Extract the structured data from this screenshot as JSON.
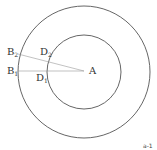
{
  "diagram": {
    "type": "concentric-circles",
    "center_label": "A",
    "outer_circle": {
      "cx": 84,
      "cy": 72,
      "r": 66
    },
    "inner_circle": {
      "cx": 84,
      "cy": 72,
      "r": 37
    },
    "points": [
      {
        "name": "B2",
        "base": "B",
        "sub": "2"
      },
      {
        "name": "B1",
        "base": "B",
        "sub": "1"
      },
      {
        "name": "D2",
        "base": "D",
        "sub": "2"
      },
      {
        "name": "D1",
        "base": "D",
        "sub": "1"
      }
    ],
    "segments": [
      "A-B2",
      "A-B1"
    ],
    "footnote": "a-1",
    "line_color": "#555555"
  }
}
